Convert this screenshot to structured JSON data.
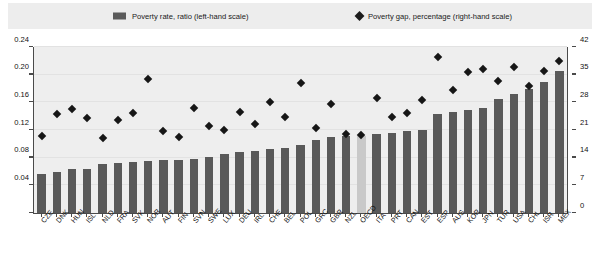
{
  "legend": {
    "bars_label": "Poverty rate, ratio (left-hand scale)",
    "diamond_label": "Poverty gap, percentage (right-hand scale)",
    "bars_swatch_icon": "filled-rectangle-icon",
    "diamond_swatch_icon": "filled-diamond-icon"
  },
  "axes": {
    "left_ticks": [
      "0",
      "0.04",
      "0.08",
      "0.12",
      "0.16",
      "0.20",
      "0.24"
    ],
    "right_ticks": [
      "0",
      "7",
      "14",
      "21",
      "28",
      "35",
      "42"
    ]
  },
  "colors": {
    "bar": "#595959",
    "bar_highlight": "#c9c9c9",
    "diamond": "#161616",
    "plot_background": "#eeeeee",
    "legend_background": "#ededed",
    "axis": "#4a4a4a"
  },
  "chart_data": {
    "type": "bar",
    "title": "",
    "subtitle": "",
    "xlabel": "",
    "ylabel": "",
    "y2label": "",
    "ylim": [
      0,
      0.24
    ],
    "y2lim": [
      0,
      42
    ],
    "grid": true,
    "legend_position": "top",
    "highlight_category": "OECD",
    "categories": [
      "CZE",
      "DNK",
      "HUN",
      "ISL",
      "NLD",
      "FRA",
      "SVK",
      "NOR",
      "AUT",
      "FIN",
      "SVN",
      "SWE",
      "LUX",
      "DEU",
      "IRL",
      "CHE",
      "BEL",
      "POL",
      "GRC",
      "GBR",
      "NZL",
      "OECD",
      "ITA",
      "PRT",
      "CAN",
      "EST",
      "ESP",
      "AUS",
      "KOR",
      "JPN",
      "TUR",
      "USA",
      "CHL",
      "ISR",
      "MEX"
    ],
    "series": [
      {
        "name": "Poverty rate, ratio (left-hand scale)",
        "axis": "left",
        "type": "bar",
        "values": [
          0.056,
          0.06,
          0.064,
          0.064,
          0.071,
          0.073,
          0.074,
          0.075,
          0.076,
          0.077,
          0.078,
          0.081,
          0.086,
          0.088,
          0.09,
          0.092,
          0.094,
          0.098,
          0.105,
          0.11,
          0.111,
          0.112,
          0.114,
          0.116,
          0.119,
          0.12,
          0.143,
          0.146,
          0.149,
          0.152,
          0.165,
          0.172,
          0.18,
          0.19,
          0.205
        ]
      },
      {
        "name": "Poverty gap, percentage (right-hand scale)",
        "axis": "right",
        "type": "scatter",
        "marker": "diamond",
        "values": [
          19.5,
          25.0,
          26.2,
          24.0,
          19.0,
          23.6,
          25.3,
          34.0,
          20.8,
          19.3,
          26.5,
          22.0,
          21.0,
          25.6,
          22.6,
          28.0,
          24.2,
          33.0,
          21.5,
          27.5,
          20.0,
          19.8,
          29.0,
          24.2,
          25.2,
          28.5,
          39.5,
          31.0,
          35.8,
          36.5,
          33.5,
          37.0,
          32.2,
          36.0,
          38.5
        ]
      }
    ]
  }
}
